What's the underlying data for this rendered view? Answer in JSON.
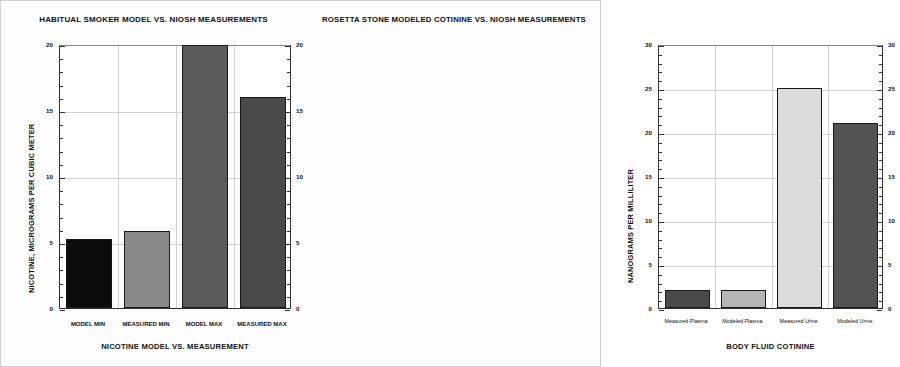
{
  "chart_data": [
    {
      "type": "bar",
      "id": "habitual-smoker-nicotine",
      "title": "HABITUAL SMOKER MODEL  VS. NIOSH MEASUREMENTS",
      "xlabel": "NICOTINE MODEL VS. MEASUREMENT",
      "ylabel": "NICOTINE, MICROGRAMS PER CUBIC METER",
      "categories": [
        "MODEL MIN",
        "MEASURED MIN",
        "MODEL MAX",
        "MEASURED MAX"
      ],
      "values": [
        5.2,
        5.8,
        19.9,
        16.0
      ],
      "bar_colors": [
        "#0b0b0b",
        "#8a8a8a",
        "#5a5a5a",
        "#4a4a4a"
      ],
      "ylim": [
        0,
        20
      ],
      "ytick_labels": [
        "0",
        "5",
        "10",
        "15",
        "20"
      ],
      "ytick_values": [
        0,
        5,
        10,
        15,
        20
      ],
      "minor_tick_step": 1,
      "grid": true,
      "legend": "none",
      "mirrored_axis": true
    },
    {
      "type": "bar",
      "id": "rosetta-stone-cotinine",
      "title": "ROSETTA STONE MODELED COTININE VS. NIOSH MEASUREMENTS",
      "xlabel": "BODY FLUID COTININE",
      "ylabel": "NANOGRAMS PER MILLILITER",
      "categories": [
        "Measured Plasma",
        "Modeled Plasma",
        "Measured Urine",
        "Modeled Urine"
      ],
      "values": [
        2.0,
        2.0,
        25.0,
        21.0
      ],
      "bar_colors": [
        "#4a4a4a",
        "#b5b5b5",
        "#dcdcdc",
        "#535353"
      ],
      "ylim": [
        0,
        30
      ],
      "ytick_labels": [
        "0",
        "5",
        "10",
        "15",
        "20",
        "25",
        "30"
      ],
      "ytick_values": [
        0,
        5,
        10,
        15,
        20,
        25,
        30
      ],
      "minor_tick_step": 1,
      "grid": true,
      "legend": "none",
      "mirrored_axis": true
    }
  ],
  "page": {
    "background_color": "#fdfdfd",
    "axis_color": "#333333",
    "grid_color": "#d2d2d2"
  }
}
